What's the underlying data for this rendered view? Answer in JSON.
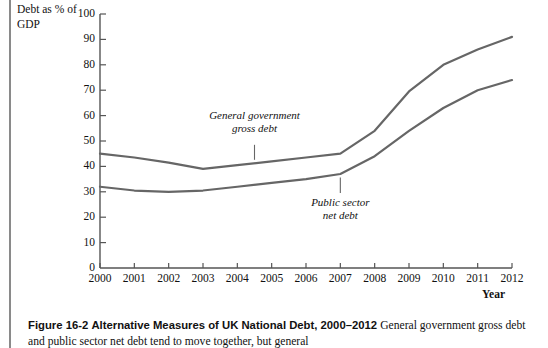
{
  "figure": {
    "y_axis_title": "Debt as %\nof GDP",
    "x_axis_title": "Year",
    "annotation_gross": "General government\ngross debt",
    "annotation_net": "Public sector\nnet debt",
    "line_color": "#666666",
    "axis_color": "#555555"
  },
  "caption": {
    "label": "Figure 16-2",
    "title": "Alternative Measures of UK National Debt, 2000–2012",
    "body": "General government gross debt and public sector net debt tend to move together, but general"
  },
  "chart_data": {
    "type": "line",
    "xlabel": "Year",
    "ylabel": "Debt as % of GDP",
    "xlim": [
      2000,
      2012
    ],
    "ylim": [
      0,
      100
    ],
    "ytick_step": 10,
    "grid": false,
    "legend": "inline-annotations",
    "x": [
      2000,
      2001,
      2002,
      2003,
      2004,
      2005,
      2006,
      2007,
      2008,
      2009,
      2010,
      2011,
      2012
    ],
    "xticklabels": [
      "2000",
      "2001",
      "2002",
      "2003",
      "2004",
      "2005",
      "2006",
      "2007",
      "2008",
      "2009",
      "2010",
      "2011",
      "2012"
    ],
    "yticklabels": [
      "0",
      "10",
      "20",
      "30",
      "40",
      "50",
      "60",
      "70",
      "80",
      "90",
      "100"
    ],
    "series": [
      {
        "name": "General government gross debt",
        "values": [
          45,
          43.5,
          41.5,
          39,
          40.5,
          42,
          43.5,
          45,
          54,
          69.5,
          80,
          86,
          91
        ]
      },
      {
        "name": "Public sector net debt",
        "values": [
          32,
          30.5,
          30,
          30.5,
          32,
          33.5,
          35,
          37,
          44,
          54,
          63,
          70,
          74
        ]
      }
    ]
  }
}
